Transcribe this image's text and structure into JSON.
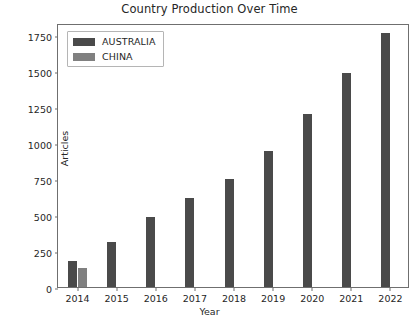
{
  "chart_data": {
    "type": "bar",
    "title": "Country Production Over Time",
    "xlabel": "Year",
    "ylabel": "Articles",
    "categories": [
      "2014",
      "2015",
      "2016",
      "2017",
      "2018",
      "2019",
      "2020",
      "2021",
      "2022"
    ],
    "series": [
      {
        "name": "AUSTRALIA",
        "color": "#4a4a4a",
        "values": [
          180,
          310,
          485,
          620,
          750,
          945,
          1197,
          1485,
          1760
        ]
      },
      {
        "name": "CHINA",
        "color": "#808080",
        "values": [
          135,
          0,
          0,
          0,
          0,
          0,
          0,
          0,
          0
        ]
      }
    ],
    "ylim": [
      0,
      1830
    ],
    "yticks": [
      0,
      250,
      500,
      750,
      1000,
      1250,
      1500,
      1750
    ],
    "ytick_labels": [
      "0",
      "250",
      "500",
      "750",
      "1000",
      "1250",
      "1500",
      "1750"
    ],
    "grid": false,
    "legend_position": "upper left"
  },
  "legend": {
    "entries": [
      {
        "label": "AUSTRALIA",
        "color": "#4a4a4a"
      },
      {
        "label": "CHINA",
        "color": "#808080"
      }
    ]
  }
}
